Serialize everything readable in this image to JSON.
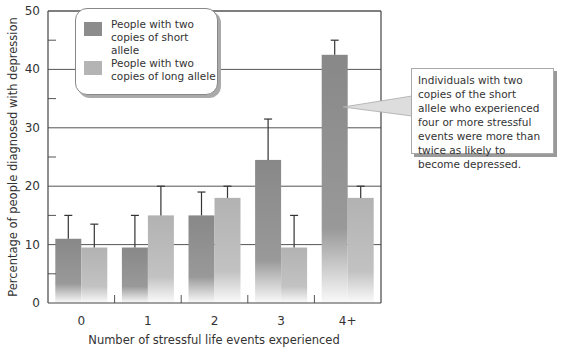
{
  "chart_data": {
    "type": "bar",
    "title": "",
    "xlabel": "Number of stressful life events experienced",
    "ylabel": "Percentage of people diagnosed with depression",
    "categories": [
      "0",
      "1",
      "2",
      "3",
      "4+"
    ],
    "yticks": [
      0,
      10,
      20,
      30,
      40,
      50
    ],
    "ylim": [
      0,
      50
    ],
    "grid": true,
    "legend_position": "top-left",
    "series": [
      {
        "name": "People with two copies of short allele",
        "color": "#8c8c8c",
        "values": [
          11,
          9.5,
          15,
          24.5,
          42.5
        ],
        "error_upper": [
          15,
          15,
          19,
          31.5,
          45
        ]
      },
      {
        "name": "People with two copies of long allele",
        "color": "#b4b4b4",
        "values": [
          9.5,
          15,
          18,
          9.5,
          18
        ],
        "error_upper": [
          13.5,
          20,
          20,
          15,
          20
        ]
      }
    ],
    "annotations": [
      {
        "target": "4+ short allele",
        "text": "Individuals with two copies of the short allele who experienced four or more stressful events were more than twice as likely to become depressed."
      }
    ]
  },
  "legend": {
    "items": [
      {
        "label_line1": "People with two",
        "label_line2": "copies of short allele",
        "color": "#8c8c8c"
      },
      {
        "label_line1": "People with two",
        "label_line2": "copies of long allele",
        "color": "#b4b4b4"
      }
    ]
  },
  "callout": {
    "text": "Individuals with two copies of the short allele who experienced four or more stressful events were more than twice as likely to become depressed."
  }
}
